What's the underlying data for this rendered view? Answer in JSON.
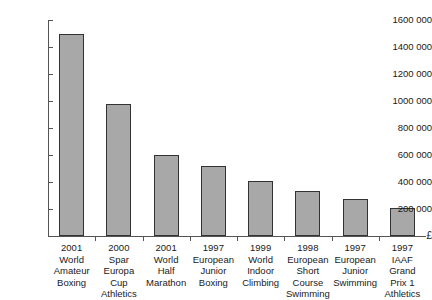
{
  "chart_data": {
    "type": "bar",
    "title": "",
    "xlabel": "",
    "ylabel": "£",
    "currency_symbol": "£",
    "ylim": [
      0,
      1600000
    ],
    "grid": false,
    "legend": false,
    "ytick_labels": [
      "1600 000",
      "1400 000",
      "1200 000",
      "1000 000",
      "800 000",
      "600 000",
      "400 000",
      "200 000"
    ],
    "ytick_values": [
      1600000,
      1400000,
      1200000,
      1000000,
      800000,
      600000,
      400000,
      200000
    ],
    "categories": [
      "2001 World Amateur Boxing",
      "2000 Spar Europa Cup Athletics",
      "2001 World Half Marathon",
      "1997 European Junior Boxing",
      "1999 World Indoor Climbing",
      "1998 European Short Course Swimming",
      "1997 European Junior Swimming",
      "1997 IAAF Grand Prix 1 Athletics"
    ],
    "category_lines": [
      [
        "2001",
        "World",
        "Amateur",
        "Boxing"
      ],
      [
        "2000",
        "Spar",
        "Europa",
        "Cup",
        "Athletics"
      ],
      [
        "2001",
        "World",
        "Half",
        "Marathon"
      ],
      [
        "1997",
        "European",
        "Junior",
        "Boxing"
      ],
      [
        "1999",
        "World",
        "Indoor",
        "Climbing"
      ],
      [
        "1998",
        "European",
        "Short",
        "Course",
        "Swimming"
      ],
      [
        "1997",
        "European",
        "Junior",
        "Swimming"
      ],
      [
        "1997",
        "IAAF",
        "Grand",
        "Prix 1",
        "Athletics"
      ]
    ],
    "values": [
      1500000,
      975000,
      600000,
      520000,
      410000,
      330000,
      275000,
      205000
    ],
    "bar_color": "#a8a8a8",
    "bar_border_color": "#333333",
    "axis_color": "#555555"
  }
}
